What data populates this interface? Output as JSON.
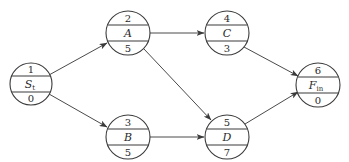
{
  "diagram": {
    "type": "activity-on-node network",
    "nodes": [
      {
        "id": "S",
        "top": "1",
        "label": "S",
        "sub": "t",
        "bottom": "0",
        "cx": 31,
        "cy": 84
      },
      {
        "id": "A",
        "top": "2",
        "label": "A",
        "sub": "",
        "bottom": "5",
        "cx": 128,
        "cy": 33
      },
      {
        "id": "B",
        "top": "3",
        "label": "B",
        "sub": "",
        "bottom": "5",
        "cx": 128,
        "cy": 137
      },
      {
        "id": "C",
        "top": "4",
        "label": "C",
        "sub": "",
        "bottom": "3",
        "cx": 227,
        "cy": 33
      },
      {
        "id": "D",
        "top": "5",
        "label": "D",
        "sub": "",
        "bottom": "7",
        "cx": 227,
        "cy": 137
      },
      {
        "id": "F",
        "top": "6",
        "label": "F",
        "sub": "in",
        "bottom": "0",
        "cx": 318,
        "cy": 85
      }
    ],
    "edges": [
      {
        "from": "S",
        "to": "A"
      },
      {
        "from": "S",
        "to": "B"
      },
      {
        "from": "A",
        "to": "C"
      },
      {
        "from": "A",
        "to": "D"
      },
      {
        "from": "B",
        "to": "D"
      },
      {
        "from": "C",
        "to": "F"
      },
      {
        "from": "D",
        "to": "F"
      }
    ]
  }
}
